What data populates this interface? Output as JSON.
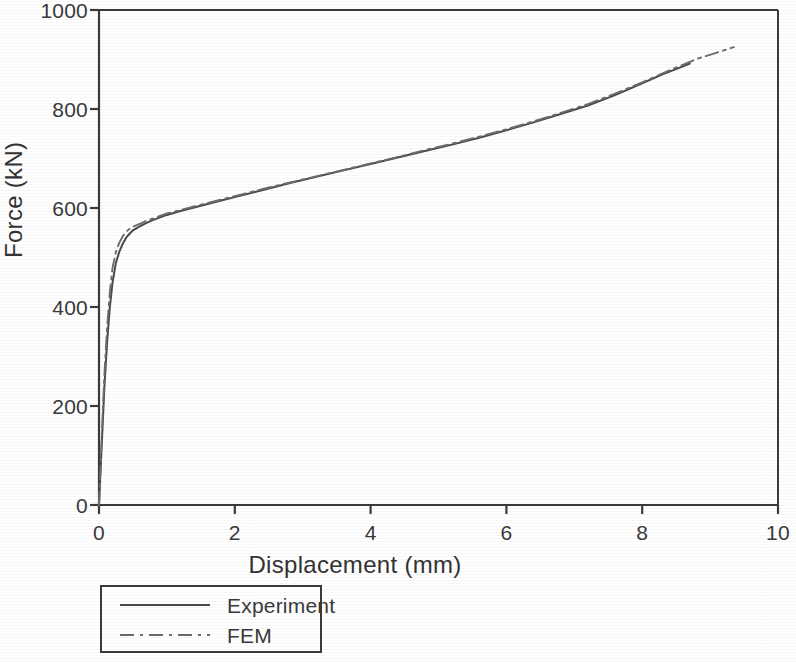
{
  "chart_data": {
    "type": "line",
    "title": "",
    "xlabel": "Displacement (mm)",
    "ylabel": "Force (kN)",
    "xlim": [
      0,
      10
    ],
    "ylim": [
      0,
      1000
    ],
    "xticks": [
      "0",
      "2",
      "4",
      "6",
      "8",
      "10"
    ],
    "yticks": [
      "0",
      "200",
      "400",
      "600",
      "800",
      "1000"
    ],
    "xtick_values": [
      0,
      2,
      4,
      6,
      8,
      10
    ],
    "ytick_values": [
      0,
      200,
      400,
      600,
      800,
      1000
    ],
    "grid": false,
    "legend_position": "below-axes-left",
    "series": [
      {
        "name": "Experiment",
        "style": "solid",
        "color": "#4a4a4a",
        "x": [
          0,
          0.02,
          0.05,
          0.08,
          0.12,
          0.16,
          0.2,
          0.25,
          0.3,
          0.35,
          0.4,
          0.45,
          0.5,
          0.6,
          0.7,
          0.8,
          0.9,
          1.0,
          1.2,
          1.4,
          1.6,
          1.8,
          2.0,
          2.4,
          2.8,
          3.2,
          3.6,
          4.0,
          4.4,
          4.8,
          5.2,
          5.6,
          6.0,
          6.4,
          6.8,
          7.2,
          7.6,
          8.0,
          8.3,
          8.6,
          8.7
        ],
        "y": [
          0,
          60,
          150,
          240,
          330,
          400,
          450,
          490,
          512,
          528,
          540,
          548,
          555,
          563,
          570,
          576,
          581,
          586,
          594,
          601,
          608,
          615,
          622,
          636,
          650,
          663,
          676,
          689,
          702,
          715,
          728,
          742,
          757,
          773,
          790,
          807,
          828,
          852,
          870,
          886,
          892
        ]
      },
      {
        "name": "FEM",
        "style": "dash-dot",
        "color": "#6d6d6d",
        "x": [
          0,
          0.02,
          0.05,
          0.08,
          0.12,
          0.16,
          0.2,
          0.25,
          0.3,
          0.35,
          0.4,
          0.45,
          0.5,
          0.6,
          0.7,
          0.8,
          0.9,
          1.0,
          1.2,
          1.4,
          1.6,
          1.8,
          2.0,
          2.4,
          2.8,
          3.2,
          3.6,
          4.0,
          4.4,
          4.8,
          5.2,
          5.6,
          6.0,
          6.4,
          6.8,
          7.2,
          7.6,
          8.0,
          8.4,
          8.8,
          9.1,
          9.35
        ],
        "y": [
          0,
          70,
          170,
          265,
          360,
          430,
          480,
          512,
          530,
          543,
          552,
          558,
          562,
          568,
          574,
          579,
          584,
          589,
          596,
          603,
          610,
          617,
          624,
          638,
          651,
          664,
          677,
          690,
          703,
          717,
          730,
          744,
          759,
          775,
          792,
          810,
          831,
          854,
          878,
          901,
          914,
          925
        ]
      }
    ]
  },
  "legend": {
    "items": [
      {
        "label": "Experiment",
        "style": "solid"
      },
      {
        "label": "FEM",
        "style": "dash-dot"
      }
    ]
  },
  "colors": {
    "axis": "#3b3b3b",
    "experiment": "#4a4a4a",
    "fem": "#6d6d6d",
    "background": "#ffffff"
  }
}
